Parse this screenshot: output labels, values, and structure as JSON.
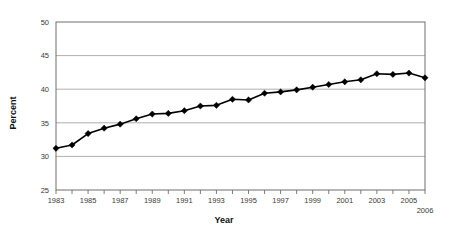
{
  "chart_data": {
    "type": "line",
    "title": "",
    "xlabel": "Year",
    "ylabel": "Percent",
    "xlim": [
      1983,
      2006
    ],
    "ylim": [
      25,
      50
    ],
    "yticks": [
      25,
      30,
      35,
      40,
      45,
      50
    ],
    "ytick_labels": [
      "25",
      "30",
      "35",
      "40",
      "45",
      "50"
    ],
    "xticks": [
      1983,
      1984,
      1985,
      1986,
      1987,
      1988,
      1989,
      1990,
      1991,
      1992,
      1993,
      1994,
      1995,
      1996,
      1997,
      1998,
      1999,
      2000,
      2001,
      2002,
      2003,
      2004,
      2005,
      2006
    ],
    "xtick_labels_shown": [
      "1983",
      "1985",
      "1987",
      "1989",
      "1991",
      "1993",
      "1995",
      "1997",
      "1999",
      "2001",
      "2003",
      "2005"
    ],
    "xtick_label_end": "2006",
    "grid": "horizontal",
    "legend": "none",
    "marker": "diamond",
    "line_color": "#000000",
    "grid_color": "#9a9a9a",
    "x": [
      1983,
      1984,
      1985,
      1986,
      1987,
      1988,
      1989,
      1990,
      1991,
      1992,
      1993,
      1994,
      1995,
      1996,
      1997,
      1998,
      1999,
      2000,
      2001,
      2002,
      2003,
      2004,
      2005,
      2006
    ],
    "values": [
      31.2,
      31.7,
      33.4,
      34.2,
      34.8,
      35.6,
      36.3,
      36.4,
      36.8,
      37.5,
      37.6,
      38.5,
      38.4,
      39.4,
      39.6,
      39.9,
      40.3,
      40.7,
      41.1,
      41.4,
      42.3,
      42.2,
      42.4,
      41.7
    ],
    "series": [
      {
        "name": "Percent",
        "values": [
          31.2,
          31.7,
          33.4,
          34.2,
          34.8,
          35.6,
          36.3,
          36.4,
          36.8,
          37.5,
          37.6,
          38.5,
          38.4,
          39.4,
          39.6,
          39.9,
          40.3,
          40.7,
          41.1,
          41.4,
          42.3,
          42.2,
          42.4,
          41.7
        ]
      }
    ]
  }
}
